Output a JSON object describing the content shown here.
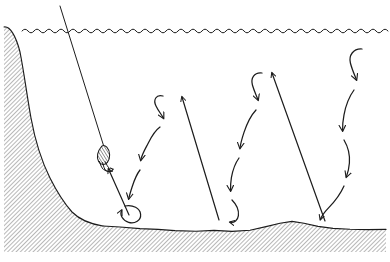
{
  "diagram": {
    "view": "underwater side cross-section",
    "background_color": "#ffffff",
    "ink_color": "#1c1c1c",
    "hatch_color": "#5a5a5a",
    "frame": {
      "width": 390,
      "height": 262,
      "border": "none"
    },
    "labels": [],
    "elements": {
      "water_surface": {
        "name": "water-surface",
        "style": "wavy scalloped line",
        "y": 31,
        "x_start": 22,
        "x_end": 390,
        "wave_count": 60,
        "wave_amplitude": 2.4
      },
      "shoreline_slope": {
        "name": "left-shoreline-slope",
        "style": "steep hatched embankment",
        "description": "steep bank descending from surface at left edge to lake bed"
      },
      "lake_bed": {
        "name": "lake-bed",
        "style": "irregular undulating hatched bottom",
        "description": "soft uneven bottom contour spanning full width"
      },
      "hatching": {
        "name": "substrate-hatching",
        "angle_deg": 45,
        "spacing_px": 3
      },
      "fishing_line": {
        "name": "fishing-line",
        "style": "straight taut line from above surface to jig",
        "from": [
          60,
          6
        ],
        "to": [
          104,
          148
        ]
      },
      "jig_lure": {
        "name": "jig-lure",
        "style": "striped tear-drop jig body with hook",
        "position": [
          103,
          152
        ],
        "body_stripes": 6
      }
    },
    "motion": {
      "lift_arrows": {
        "name": "lift-stroke-arrow",
        "meaning": "upward rod lift / jig stroke",
        "style": "straight line with open arrowhead",
        "count": 3
      },
      "fall_arrows": {
        "name": "flutter-fall-arrow",
        "meaning": "fluttering descent of the jig on slack line",
        "style": "S-curved zigzag with open arrowheads",
        "count": 4
      },
      "loop_arrow": {
        "name": "bottom-contact-loop-arrow",
        "meaning": "jig touches bottom then restarts cycle",
        "count": 1
      },
      "cycles": [
        {
          "id": "cycle-1",
          "fall_path_top": [
            168,
            95
          ],
          "fall_path_bottom": [
            127,
            218
          ],
          "lift_from": [
            129,
            215
          ],
          "lift_to": [
            107,
            166
          ]
        },
        {
          "id": "cycle-2",
          "fall_path_top": [
            268,
            72
          ],
          "fall_path_bottom": [
            232,
            222
          ],
          "lift_from": [
            219,
            219
          ],
          "lift_to": [
            182,
            96
          ]
        },
        {
          "id": "cycle-3",
          "fall_path_top": [
            366,
            48
          ],
          "fall_path_bottom": [
            322,
            222
          ],
          "lift_from": [
            325,
            220
          ],
          "lift_to": [
            272,
            72
          ]
        }
      ]
    }
  }
}
